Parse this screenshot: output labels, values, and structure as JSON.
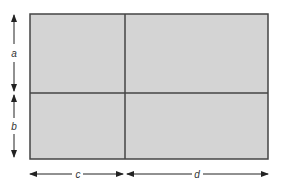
{
  "diagram": {
    "type": "area-model-rectangle",
    "fill_color": "#d4d4d4",
    "stroke_color": "#444444",
    "labels": {
      "top_height": "a",
      "bottom_height": "b",
      "left_width": "c",
      "right_width": "d"
    },
    "regions": [
      {
        "row": "a",
        "col": "c"
      },
      {
        "row": "a",
        "col": "d"
      },
      {
        "row": "b",
        "col": "c"
      },
      {
        "row": "b",
        "col": "d"
      }
    ]
  }
}
